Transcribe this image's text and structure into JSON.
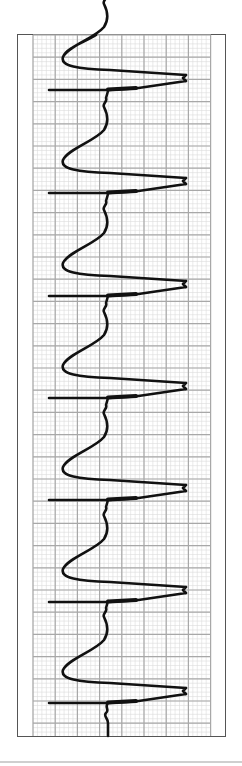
{
  "chart_data": {
    "type": "line",
    "title": "",
    "xlabel": "",
    "ylabel": "",
    "orientation": "rotated-90 (time runs top to bottom)",
    "grid": {
      "on": true,
      "major_spacing_px": 22.2,
      "minor_per_major": 5,
      "major_color": "#a8a8a8",
      "minor_color": "#dcdcdc"
    },
    "beats_y_px": [
      90,
      193,
      296,
      398,
      500,
      602,
      703
    ],
    "beat_count": 7,
    "period_px": 102.2,
    "trace_color": "#111111",
    "frame_color": "#555555"
  },
  "strip": {
    "frame": {
      "x": 17,
      "y": 34,
      "width": 209,
      "height": 703
    },
    "grid": {
      "x": 33,
      "y": 35,
      "width": 178,
      "height": 701
    }
  }
}
